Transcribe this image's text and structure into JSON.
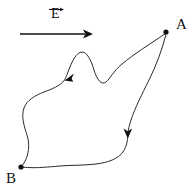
{
  "figure": {
    "kind": "physics-field-path-diagram",
    "background_color": "#ffffff",
    "stroke_color": "#2b2b2b",
    "ink_color": "#111111",
    "width": 195,
    "height": 191
  },
  "field": {
    "label": "E",
    "vector_notation": "arrow-overbar",
    "direction": "rightward",
    "line": {
      "x1": 20,
      "y1": 34,
      "x2": 85,
      "y2": 34
    },
    "arrow_tip_x": 93,
    "label_position": {
      "x": 51,
      "y": 7
    }
  },
  "points": [
    {
      "id": "A",
      "label": "A",
      "dot": {
        "cx": 166,
        "cy": 32,
        "r": 2.6
      },
      "label_position": {
        "x": 176,
        "y": 17
      }
    },
    {
      "id": "B",
      "label": "B",
      "dot": {
        "cx": 21,
        "cy": 167,
        "r": 2.6
      },
      "label_position": {
        "x": 6,
        "y": 171
      }
    }
  ],
  "paths": [
    {
      "id": "upper-path",
      "from": "A",
      "to": "B",
      "description": "upper wavy path from A leftward over a crest, through arrowhead, down the left side to B",
      "d": "M 165.5 33.5 C 150 44 134 54 122 64 C 113 71.5 110 79 106 82 C 101.5 85.5 97 80 94 70 C 91 60 87 52 82 52 C 76.5 52 72 61 68 72 C 66.6 75.8 65.6 78 64.6 80 C 60 86 52 89 44 92 C 35 95.5 27 100 24 108 C 21 116 24 126 27 135 C 30 144 29 155 24 163 C 22.6 165 21.8 166.2 21.2 166.8",
      "arrowhead": {
        "x": 66,
        "y": 79,
        "angle_deg": 125,
        "size": 8
      }
    },
    {
      "id": "lower-path",
      "from": "A",
      "to": "B",
      "description": "lower path from A sweeping down the right side, through arrowhead, then leftward along the bottom to B",
      "d": "M 166 34.5 C 162 50 156 66 149 80 C 142 94 135 108 131 120 C 129 126 128.2 130 128 133.5 C 127.6 140 127 146 123 152 C 118 159 108 162.5 96 164 C 84 165.5 72 165 60 166 C 48 167 38 168 30 167.6 C 26 167.4 23.4 167.2 21.8 167.1",
      "arrowhead": {
        "x": 128,
        "y": 136,
        "angle_deg": 92,
        "size": 8
      }
    }
  ]
}
